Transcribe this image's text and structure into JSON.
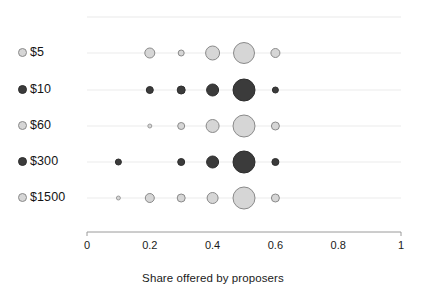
{
  "chart_data": {
    "type": "scatter",
    "title": "",
    "subtitle": "",
    "xlabel": "Share offered by proposers",
    "ylabel": "",
    "xlim": [
      0,
      1
    ],
    "xticks": [
      0,
      0.2,
      0.4,
      0.6,
      0.8,
      1
    ],
    "xticklabels": [
      "0",
      "0.2",
      "0.4",
      "0.6",
      "0.8",
      "1"
    ],
    "categories": [
      "$5",
      "$10",
      "$60",
      "$300",
      "$1500"
    ],
    "grid": true,
    "grid_axis": "y",
    "legend": "none",
    "marker_encoding": "bubble size = relative frequency of offered share",
    "colors": {
      "light_fill": "#d6d6d6",
      "light_stroke": "#8a8a8a",
      "dark_fill": "#3b3b3b",
      "dark_stroke": "#2d2d2d",
      "grid": "#e6e6e6",
      "axis": "#9a9a9a",
      "text": "#1a1a1a"
    },
    "series": [
      {
        "name": "$5",
        "shade": "light",
        "points": [
          {
            "x": 0.2,
            "r": 5.0
          },
          {
            "x": 0.3,
            "r": 3.0
          },
          {
            "x": 0.4,
            "r": 7.0
          },
          {
            "x": 0.5,
            "r": 10.5
          },
          {
            "x": 0.6,
            "r": 4.5
          }
        ]
      },
      {
        "name": "$10",
        "shade": "dark",
        "points": [
          {
            "x": 0.2,
            "r": 3.5
          },
          {
            "x": 0.3,
            "r": 4.0
          },
          {
            "x": 0.4,
            "r": 6.0
          },
          {
            "x": 0.5,
            "r": 11.0
          },
          {
            "x": 0.6,
            "r": 3.0
          }
        ]
      },
      {
        "name": "$60",
        "shade": "light",
        "points": [
          {
            "x": 0.2,
            "r": 2.0
          },
          {
            "x": 0.3,
            "r": 3.5
          },
          {
            "x": 0.4,
            "r": 6.5
          },
          {
            "x": 0.5,
            "r": 11.0
          },
          {
            "x": 0.6,
            "r": 4.0
          }
        ]
      },
      {
        "name": "$300",
        "shade": "dark",
        "points": [
          {
            "x": 0.1,
            "r": 3.0
          },
          {
            "x": 0.3,
            "r": 3.5
          },
          {
            "x": 0.4,
            "r": 6.0
          },
          {
            "x": 0.5,
            "r": 11.0
          },
          {
            "x": 0.6,
            "r": 3.5
          }
        ]
      },
      {
        "name": "$1500",
        "shade": "light",
        "points": [
          {
            "x": 0.1,
            "r": 2.0
          },
          {
            "x": 0.2,
            "r": 4.5
          },
          {
            "x": 0.3,
            "r": 4.0
          },
          {
            "x": 0.4,
            "r": 5.5
          },
          {
            "x": 0.5,
            "r": 11.0
          },
          {
            "x": 0.6,
            "r": 4.0
          }
        ]
      }
    ]
  },
  "axis": {
    "x_title": "Share offered by proposers",
    "tick_labels": [
      "0",
      "0.2",
      "0.4",
      "0.6",
      "0.8",
      "1"
    ]
  },
  "categories": [
    {
      "label": "$5",
      "shade": "light"
    },
    {
      "label": "$10",
      "shade": "dark"
    },
    {
      "label": "$60",
      "shade": "light"
    },
    {
      "label": "$300",
      "shade": "dark"
    },
    {
      "label": "$1500",
      "shade": "light"
    }
  ]
}
